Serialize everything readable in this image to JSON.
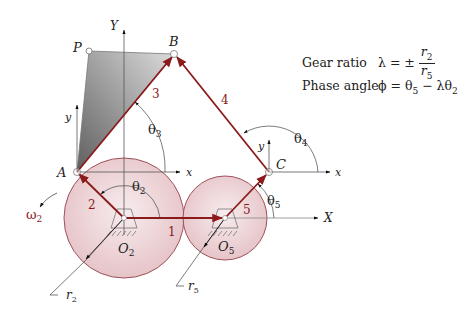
{
  "equations": {
    "gear_ratio_label": "Gear ratio",
    "gear_ratio_lhs": "λ = ±",
    "gear_ratio_num": "r",
    "gear_ratio_num_sub": "2",
    "gear_ratio_den": "r",
    "gear_ratio_den_sub": "5",
    "phase_angle_label": "Phase angle",
    "phase_angle_expr": "ϕ = θ",
    "phase_angle_sub1": "5",
    "phase_angle_mid": " − λθ",
    "phase_angle_sub2": "2"
  },
  "labels": {
    "P": "P",
    "B": "B",
    "A": "A",
    "C": "C",
    "Y": "Y",
    "X": "X",
    "y_A": "y",
    "x_A": "x",
    "y_C": "y",
    "x_C": "x",
    "O2": "O",
    "O2_sub": "2",
    "O5": "O",
    "O5_sub": "5",
    "r2": "r",
    "r2_sub": "2",
    "r5": "r",
    "r5_sub": "5",
    "omega2": "ω",
    "omega2_sub": "2",
    "theta2": "θ",
    "theta2_sub": "2",
    "theta3": "θ",
    "theta3_sub": "3",
    "theta4": "θ",
    "theta4_sub": "4",
    "theta5": "θ",
    "theta5_sub": "5"
  },
  "links": {
    "link1": "1",
    "link2": "2",
    "link3": "3",
    "link4": "4",
    "link5": "5"
  },
  "colors": {
    "link": "#8b1a1a",
    "gear_fill": "#ecd3d6",
    "gear_stroke": "#a0515a",
    "coupler_dark": "#6e6e6e",
    "coupler_light": "#d4d4d4"
  }
}
